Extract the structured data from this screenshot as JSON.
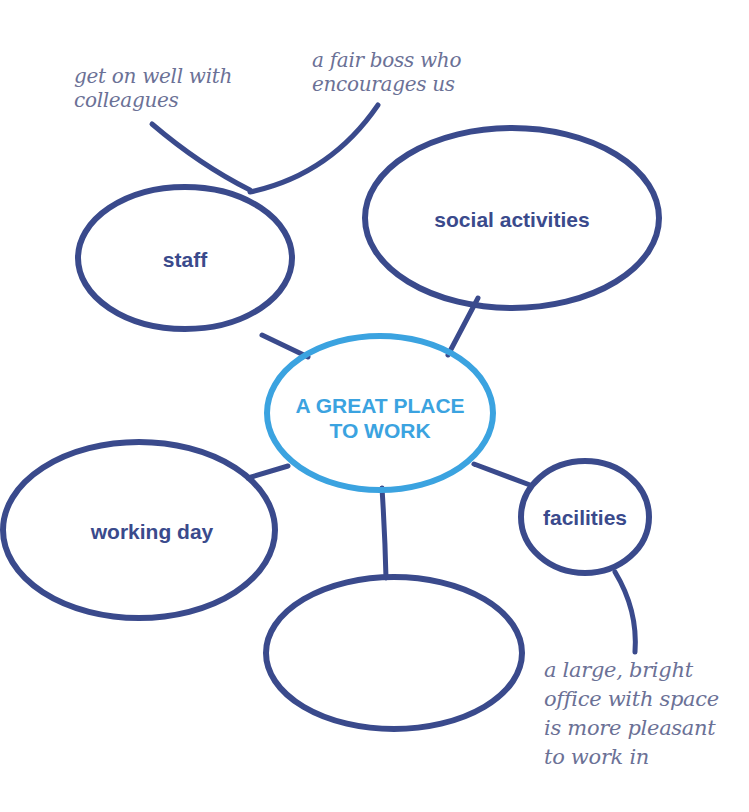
{
  "title": "A GREAT PLACE TO WORK",
  "colors": {
    "dark_blue": "#3a4a8c",
    "light_blue": "#3ba3e0",
    "note_gray": "#6b7196",
    "background": "#ffffff"
  },
  "central_node": {
    "label_line1": "A GREAT PLACE",
    "label_line2": "TO WORK"
  },
  "nodes": [
    {
      "id": "staff",
      "label": "staff"
    },
    {
      "id": "social-activities",
      "label": "social activities"
    },
    {
      "id": "working-day",
      "label": "working day"
    },
    {
      "id": "facilities",
      "label": "facilities"
    },
    {
      "id": "blank",
      "label": ""
    }
  ],
  "notes": [
    {
      "attached_to": "staff",
      "text": "get on well with\ncolleagues"
    },
    {
      "attached_to": "staff",
      "text": "a fair boss who\nencourages us"
    },
    {
      "attached_to": "facilities",
      "text": "a large, bright\noffice with space\nis more pleasant\nto work in"
    }
  ]
}
